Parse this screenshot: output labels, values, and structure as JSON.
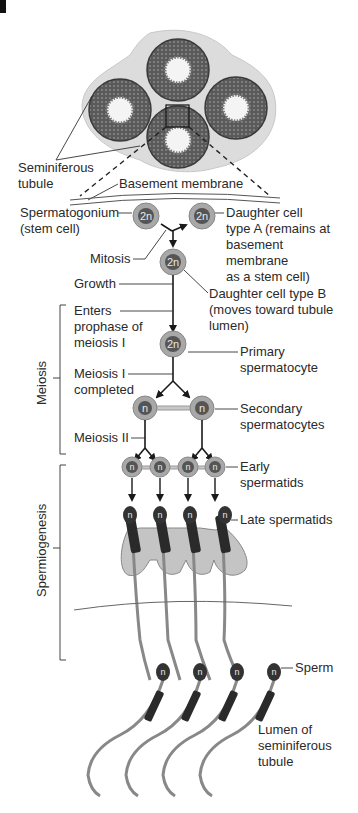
{
  "colors": {
    "background": "#ffffff",
    "cell_outer": "#a8a8a8",
    "cell_ring": "#c8c8c8",
    "nucleus": "#555555",
    "tubule_tissue": "#6a6a6a",
    "interstitial": "#dcdcdc",
    "cytoplasm_lobe": "#c4c4c4",
    "text": "#2a2a2a"
  },
  "top_illustration": {
    "label_seminiferous_tubule_1": "Seminiferous",
    "label_seminiferous_tubule_2": "tubule",
    "label_basement_membrane": "Basement membrane"
  },
  "cells": {
    "spermatogonium": {
      "ploidy": "2n",
      "label_1": "Spermatogonium",
      "label_2": "(stem cell)"
    },
    "daughter_a": {
      "ploidy": "2n",
      "label_1": "Daughter cell",
      "label_2": "type A (remains at",
      "label_3": "basement",
      "label_4": "membrane",
      "label_5": "as a stem cell)"
    },
    "daughter_b": {
      "ploidy": "2n",
      "label_1": "Daughter cell type B",
      "label_2": "(moves toward tubule",
      "label_3": "lumen)"
    },
    "primary_spermatocyte": {
      "ploidy": "2n",
      "label_1": "Primary",
      "label_2": "spermatocyte"
    },
    "secondary_spermatocytes": {
      "ploidy": "n",
      "label_1": "Secondary",
      "label_2": "spermatocytes"
    },
    "early_spermatids": {
      "ploidy": "n",
      "label_1": "Early",
      "label_2": "spermatids"
    },
    "late_spermatids": {
      "ploidy": "n",
      "label": "Late spermatids"
    },
    "sperm": {
      "ploidy": "n",
      "label": "Sperm"
    }
  },
  "process_labels": {
    "mitosis": "Mitosis",
    "growth": "Growth",
    "enters_prophase_1": "Enters",
    "enters_prophase_2": "prophase of",
    "enters_prophase_3": "meiosis I",
    "meiosis_i_completed_1": "Meiosis I",
    "meiosis_i_completed_2": "completed",
    "meiosis_ii": "Meiosis II"
  },
  "phase_brackets": {
    "meiosis": "Meiosis",
    "spermiogenesis": "Spermiogenesis"
  },
  "lumen_label": {
    "line_1": "Lumen of",
    "line_2": "seminiferous",
    "line_3": "tubule"
  }
}
